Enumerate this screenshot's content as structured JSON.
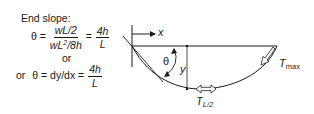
{
  "formulas": {
    "heading": "End slope:",
    "line1": {
      "lhs": "θ =",
      "frac1_num": "wL/2",
      "frac1_den_a": "wL",
      "frac1_den_sup": "2",
      "frac1_den_b": "/8h",
      "eq": "=",
      "frac2_num": "4h",
      "frac2_den": "L"
    },
    "or_middle": "or",
    "line2": {
      "prefix": "or",
      "lhs": "θ = dy/dx =",
      "frac_num": "4h",
      "frac_den": "L"
    }
  },
  "diagram": {
    "labels": {
      "x_axis": "x",
      "theta": "θ",
      "y_dim": "y",
      "t_half_main": "T",
      "t_half_sub": "L/2",
      "t_max_main": "T",
      "t_max_sub": "max"
    },
    "colors": {
      "stroke": "#1a1a1a",
      "background": "#ffffff"
    }
  }
}
